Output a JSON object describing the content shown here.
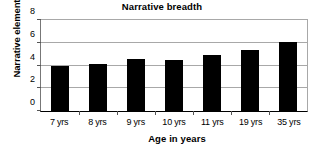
{
  "chart_data": {
    "type": "bar",
    "title": "Narrative breadth",
    "xlabel": "Age in years",
    "ylabel": "Narrative elements",
    "categories": [
      "7 yrs",
      "8 yrs",
      "9 yrs",
      "10 yrs",
      "11 yrs",
      "19 yrs",
      "35 yrs"
    ],
    "values": [
      4.0,
      4.1,
      4.6,
      4.5,
      4.9,
      5.4,
      6.1
    ],
    "ylim": [
      0,
      8
    ],
    "yticks": [
      0,
      2,
      4,
      6,
      8
    ],
    "ytick_labels": [
      "0",
      "2",
      "4",
      "6",
      "8"
    ],
    "grid": true,
    "legend": null,
    "bar_color": "#000000",
    "grid_color": "#a8a8a8",
    "axis_color": "#000000"
  }
}
